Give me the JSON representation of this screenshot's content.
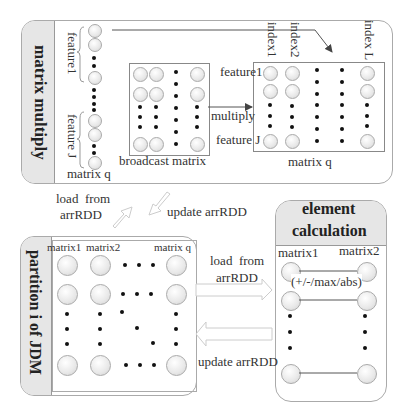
{
  "top_panel": {
    "title": "matrix multiply",
    "vector": {
      "label": "matrix q",
      "brace_labels": [
        "feature1",
        "feature J"
      ]
    },
    "broadcast": {
      "label": "broadcast matrix"
    },
    "multiply_label": "multiply",
    "result": {
      "label": "matrix q",
      "row_labels": [
        "feature1",
        "feature J"
      ],
      "column_labels": [
        "index1",
        "index2",
        "index L"
      ]
    }
  },
  "connectors": {
    "load_from_top": "load  from\narrRDD",
    "load_line1": "load  from",
    "load_line2": "arrRDD",
    "update_top": "update arrRDD",
    "load_right_line1": "load  from",
    "load_right_line2": "arrRDD",
    "update_right": "update arrRDD"
  },
  "partition_panel": {
    "title": "partition i of JDM",
    "column_labels": [
      "matrix1",
      "matrix2",
      "matrix q"
    ]
  },
  "element_panel": {
    "title_line1": "element",
    "title_line2": "calculation",
    "column_labels": [
      "matrix1",
      "matrix2"
    ],
    "operation": "(+/-/max/abs)"
  },
  "colors": {
    "panel_border": "#aaaaaa",
    "tab_fill": "#e6e6e6",
    "node_fill": "#e8e8e8",
    "arrow_outline": "#cccccc",
    "line": "#555555"
  }
}
